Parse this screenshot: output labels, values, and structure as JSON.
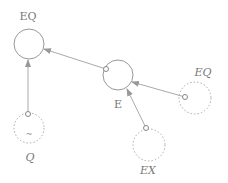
{
  "diagram": {
    "colors": {
      "stroke": "#9a9a9a",
      "text": "#777777",
      "background": "#ffffff"
    },
    "nodes": [
      {
        "id": "eq_top",
        "label": "EQ",
        "style": "solid",
        "cx": 29,
        "cy": 44,
        "r": 15,
        "label_x": 28,
        "label_y": 20,
        "italic": false
      },
      {
        "id": "e",
        "label": "E",
        "style": "solid",
        "cx": 118,
        "cy": 75,
        "r": 15,
        "label_x": 118,
        "label_y": 108,
        "italic": false
      },
      {
        "id": "eq_right",
        "label": "EQ",
        "style": "dashed",
        "cx": 195,
        "cy": 98,
        "r": 16,
        "label_x": 203,
        "label_y": 76,
        "italic": true
      },
      {
        "id": "ex",
        "label": "EX",
        "style": "dashed",
        "cx": 149,
        "cy": 145,
        "r": 16,
        "label_x": 148,
        "label_y": 174,
        "italic": true
      },
      {
        "id": "q",
        "label": "Q",
        "style": "dashed",
        "cx": 29,
        "cy": 128,
        "r": 15,
        "label_x": 30,
        "label_y": 161,
        "italic": true,
        "inner_mark": "~"
      }
    ],
    "edges": [
      {
        "from": "e",
        "to": "eq_top"
      },
      {
        "from": "q",
        "to": "eq_top"
      },
      {
        "from": "eq_right",
        "to": "e"
      },
      {
        "from": "ex",
        "to": "e"
      }
    ]
  }
}
